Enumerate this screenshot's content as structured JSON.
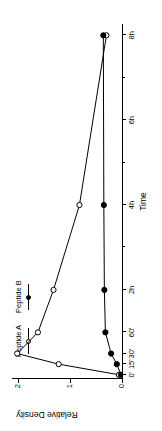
{
  "chart_data": {
    "type": "line",
    "title": "",
    "xlabel": "Time",
    "ylabel": "Relative Density",
    "ylim": [
      0,
      2.12
    ],
    "yticks": [
      0,
      1,
      2
    ],
    "ytick_labels": [
      "0",
      "1",
      "2"
    ],
    "grid": false,
    "legend_position": "top-left",
    "x_tick_labels": [
      "0'",
      "15'",
      "30'",
      "60'",
      "2h",
      "4h",
      "6h",
      "8h"
    ],
    "x_tick_positions": [
      0,
      15,
      30,
      60,
      120,
      240,
      360,
      480
    ],
    "x_minor_tick_positions": [
      60,
      180,
      300,
      420
    ],
    "x_axis_unit": "minutes",
    "xlim": [
      -6,
      496
    ],
    "series": [
      {
        "name": "Peptide A",
        "marker": "open-circle",
        "color": "#000000",
        "x": [
          0,
          15,
          30,
          60,
          120,
          240,
          480
        ],
        "y": [
          0.06,
          1.22,
          2.02,
          1.62,
          1.32,
          0.82,
          0.3
        ]
      },
      {
        "name": "Peptide B",
        "marker": "filled-circle",
        "color": "#000000",
        "x": [
          0,
          15,
          30,
          60,
          120,
          240,
          480
        ],
        "y": [
          0.02,
          0.1,
          0.21,
          0.32,
          0.34,
          0.35,
          0.36
        ]
      }
    ]
  },
  "legend": {
    "entries": [
      {
        "label": "Peptide A",
        "marker": "open-circle"
      },
      {
        "label": "Peptide B",
        "marker": "filled-circle"
      }
    ]
  },
  "axes": {
    "x_title": "Time",
    "y_title": "Relative Density"
  }
}
